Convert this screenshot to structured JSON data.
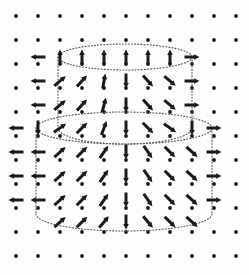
{
  "figure": {
    "width": 249,
    "height": 275,
    "background_color": "#fdfdfd",
    "ink_color": "#1a1a1a",
    "dot_color": "#1a1a1a",
    "outline_color": "#555555"
  },
  "grid": {
    "name": "background-dot-grid",
    "columns": 11,
    "rows": 11,
    "x_start": 16,
    "y_start": 16,
    "x_step": 22,
    "y_step": 24,
    "dot_radius": 1.9
  },
  "cylinders": [
    {
      "name": "small-upper-cylinder",
      "center_x": 125,
      "half_width": 67,
      "top_y": 57,
      "bottom_y": 128,
      "top_ry": 13,
      "bottom_ry": 16,
      "style": "dotted",
      "stroke_width": 1.1
    },
    {
      "name": "large-lower-cylinder",
      "center_x": 124,
      "half_width": 88,
      "top_y": 128,
      "bottom_y": 214,
      "top_ry": 16,
      "bottom_ry": 17,
      "style": "dotted",
      "stroke_width": 1.1
    }
  ],
  "chart_data": {
    "type": "scatter",
    "xlabel": "",
    "ylabel": "",
    "grid": true,
    "legend": "none",
    "arrow_length": 15,
    "arrow_head_width": 5.5,
    "arrow_shaft_width": 3.0,
    "arrows": [
      {
        "x": 38,
        "y": 57,
        "angle": 180
      },
      {
        "x": 60,
        "y": 57,
        "angle": 90
      },
      {
        "x": 82,
        "y": 57,
        "angle": 90
      },
      {
        "x": 104,
        "y": 57,
        "angle": 90
      },
      {
        "x": 126,
        "y": 57,
        "angle": 90
      },
      {
        "x": 148,
        "y": 57,
        "angle": 90
      },
      {
        "x": 170,
        "y": 57,
        "angle": 90
      },
      {
        "x": 192,
        "y": 57,
        "angle": 0
      },
      {
        "x": 38,
        "y": 81,
        "angle": 180
      },
      {
        "x": 60,
        "y": 81,
        "angle": 40
      },
      {
        "x": 82,
        "y": 81,
        "angle": 48
      },
      {
        "x": 104,
        "y": 81,
        "angle": 80
      },
      {
        "x": 126,
        "y": 81,
        "angle": 270
      },
      {
        "x": 148,
        "y": 81,
        "angle": -48
      },
      {
        "x": 170,
        "y": 81,
        "angle": -40
      },
      {
        "x": 192,
        "y": 81,
        "angle": 0
      },
      {
        "x": 38,
        "y": 105,
        "angle": 180
      },
      {
        "x": 60,
        "y": 105,
        "angle": 40
      },
      {
        "x": 82,
        "y": 105,
        "angle": 48
      },
      {
        "x": 104,
        "y": 105,
        "angle": 75
      },
      {
        "x": 126,
        "y": 105,
        "angle": 270
      },
      {
        "x": 148,
        "y": 105,
        "angle": -48
      },
      {
        "x": 170,
        "y": 105,
        "angle": -40
      },
      {
        "x": 192,
        "y": 105,
        "angle": 0
      },
      {
        "x": 16,
        "y": 128,
        "angle": 180
      },
      {
        "x": 38,
        "y": 128,
        "angle": 270
      },
      {
        "x": 60,
        "y": 128,
        "angle": 35
      },
      {
        "x": 82,
        "y": 128,
        "angle": 45
      },
      {
        "x": 104,
        "y": 128,
        "angle": 70
      },
      {
        "x": 126,
        "y": 128,
        "angle": 270
      },
      {
        "x": 148,
        "y": 128,
        "angle": -45
      },
      {
        "x": 170,
        "y": 128,
        "angle": -35
      },
      {
        "x": 192,
        "y": 128,
        "angle": 270
      },
      {
        "x": 214,
        "y": 128,
        "angle": 0
      },
      {
        "x": 16,
        "y": 152,
        "angle": 180
      },
      {
        "x": 38,
        "y": 152,
        "angle": 180
      },
      {
        "x": 60,
        "y": 152,
        "angle": 42
      },
      {
        "x": 82,
        "y": 152,
        "angle": 45
      },
      {
        "x": 104,
        "y": 152,
        "angle": 55
      },
      {
        "x": 126,
        "y": 152,
        "angle": 270
      },
      {
        "x": 148,
        "y": 152,
        "angle": -55
      },
      {
        "x": 170,
        "y": 152,
        "angle": -45
      },
      {
        "x": 192,
        "y": 152,
        "angle": -42
      },
      {
        "x": 214,
        "y": 152,
        "angle": 0
      },
      {
        "x": 16,
        "y": 176,
        "angle": 180
      },
      {
        "x": 38,
        "y": 176,
        "angle": 180
      },
      {
        "x": 60,
        "y": 176,
        "angle": 42
      },
      {
        "x": 82,
        "y": 176,
        "angle": 45
      },
      {
        "x": 104,
        "y": 176,
        "angle": 55
      },
      {
        "x": 126,
        "y": 176,
        "angle": 270
      },
      {
        "x": 148,
        "y": 176,
        "angle": -55
      },
      {
        "x": 170,
        "y": 176,
        "angle": -45
      },
      {
        "x": 192,
        "y": 176,
        "angle": -42
      },
      {
        "x": 214,
        "y": 176,
        "angle": 0
      },
      {
        "x": 16,
        "y": 200,
        "angle": 180
      },
      {
        "x": 38,
        "y": 200,
        "angle": 180
      },
      {
        "x": 60,
        "y": 200,
        "angle": 42
      },
      {
        "x": 82,
        "y": 200,
        "angle": 45
      },
      {
        "x": 104,
        "y": 200,
        "angle": 55
      },
      {
        "x": 126,
        "y": 200,
        "angle": 270
      },
      {
        "x": 148,
        "y": 200,
        "angle": -55
      },
      {
        "x": 170,
        "y": 200,
        "angle": -45
      },
      {
        "x": 192,
        "y": 200,
        "angle": -42
      },
      {
        "x": 214,
        "y": 200,
        "angle": 0
      },
      {
        "x": 60,
        "y": 222,
        "angle": 42
      },
      {
        "x": 82,
        "y": 222,
        "angle": 45
      },
      {
        "x": 104,
        "y": 222,
        "angle": 50
      },
      {
        "x": 126,
        "y": 222,
        "angle": 270
      },
      {
        "x": 148,
        "y": 222,
        "angle": -50
      },
      {
        "x": 170,
        "y": 222,
        "angle": -45
      },
      {
        "x": 192,
        "y": 222,
        "angle": -42
      }
    ]
  }
}
